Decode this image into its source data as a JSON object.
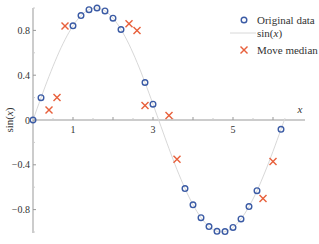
{
  "chart_data": {
    "type": "scatter",
    "title": "",
    "xlabel": "x",
    "ylabel": "sin(x)",
    "xlim": [
      0,
      6.3
    ],
    "ylim": [
      -1.0,
      1.0
    ],
    "x_ticks": [
      1,
      2,
      3,
      4,
      5,
      6
    ],
    "x_tick_labels": [
      "1",
      "",
      "3",
      "",
      "5",
      ""
    ],
    "y_ticks": [
      0.8,
      0.4,
      0,
      -0.4,
      -0.8
    ],
    "y_tick_labels": [
      "0.8",
      "0.4",
      "0",
      "−0.4",
      "−0.8"
    ],
    "grid": false,
    "legend_position": "upper right",
    "colors": {
      "original": "#3b5ba5",
      "curve": "#d8d8d8",
      "median": "#e8603c",
      "axis": "#999999"
    },
    "series": [
      {
        "name": "Original data",
        "marker": "circle",
        "x": [
          0.0,
          0.2,
          1.0,
          1.2,
          1.4,
          1.6,
          1.8,
          2.0,
          2.2,
          2.8,
          3.0,
          3.8,
          4.0,
          4.2,
          4.4,
          4.6,
          4.8,
          5.0,
          5.2,
          5.4,
          5.6,
          6.2
        ],
        "y": [
          0.0,
          0.199,
          0.841,
          0.932,
          0.985,
          1.0,
          0.974,
          0.909,
          0.808,
          0.335,
          0.141,
          -0.612,
          -0.757,
          -0.872,
          -0.952,
          -0.994,
          -0.996,
          -0.959,
          -0.883,
          -0.773,
          -0.631,
          -0.083
        ]
      },
      {
        "name": "sin(x)",
        "marker": "line",
        "x_range": [
          0,
          6.3
        ]
      },
      {
        "name": "Move median",
        "marker": "x",
        "x": [
          0.4,
          0.6,
          0.8,
          2.4,
          2.6,
          2.8,
          3.4,
          3.6,
          5.75,
          6.0
        ],
        "y": [
          0.09,
          0.2,
          0.84,
          0.86,
          0.8,
          0.13,
          0.04,
          -0.35,
          -0.7,
          -0.37
        ]
      }
    ]
  }
}
